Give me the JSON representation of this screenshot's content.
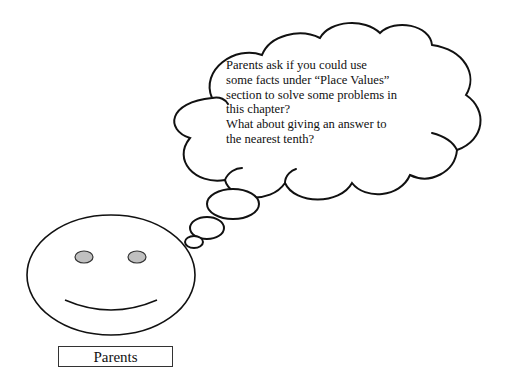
{
  "thought_bubble": {
    "lines": [
      "Parents ask if you could use",
      "some facts under “Place Values”",
      "section to solve some problems in",
      "this chapter?",
      "What about giving an answer to",
      "the nearest tenth?"
    ]
  },
  "character": {
    "label": "Parents",
    "face": "smiley-face",
    "eye_color": "#c0c0c0"
  }
}
